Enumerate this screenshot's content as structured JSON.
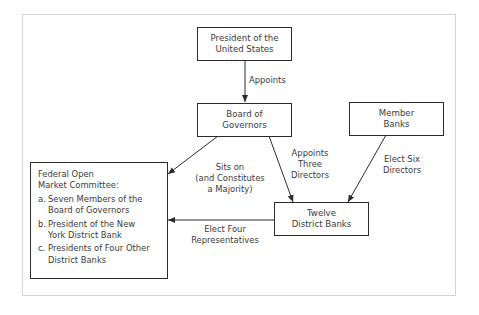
{
  "nodes": {
    "president": {
      "line1": "President of the",
      "line2": "United States"
    },
    "board": {
      "line1": "Board of",
      "line2": "Governors"
    },
    "member_banks": {
      "line1": "Member",
      "line2": "Banks"
    },
    "district_banks": {
      "line1": "Twelve",
      "line2": "District Banks"
    },
    "fomc": {
      "title1": "Federal Open",
      "title2": "Market Committee:",
      "items": [
        {
          "marker": "a.",
          "line1": "Seven Members of the",
          "line2": "Board of Governors"
        },
        {
          "marker": "b.",
          "line1": "President of the New",
          "line2": "York District Bank"
        },
        {
          "marker": "c.",
          "line1": "Presidents of Four Other",
          "line2": "District Banks"
        }
      ]
    }
  },
  "edges": {
    "president_to_board": {
      "line1": "Appoints"
    },
    "board_to_fomc": {
      "line1": "Sits on",
      "line2": "(and Constitutes",
      "line3": "a Majority)"
    },
    "board_to_district": {
      "line1": "Appoints",
      "line2": "Three",
      "line3": "Directors"
    },
    "member_to_district": {
      "line1": "Elect Six",
      "line2": "Directors"
    },
    "district_to_fomc": {
      "line1": "Elect Four",
      "line2": "Representatives"
    }
  }
}
